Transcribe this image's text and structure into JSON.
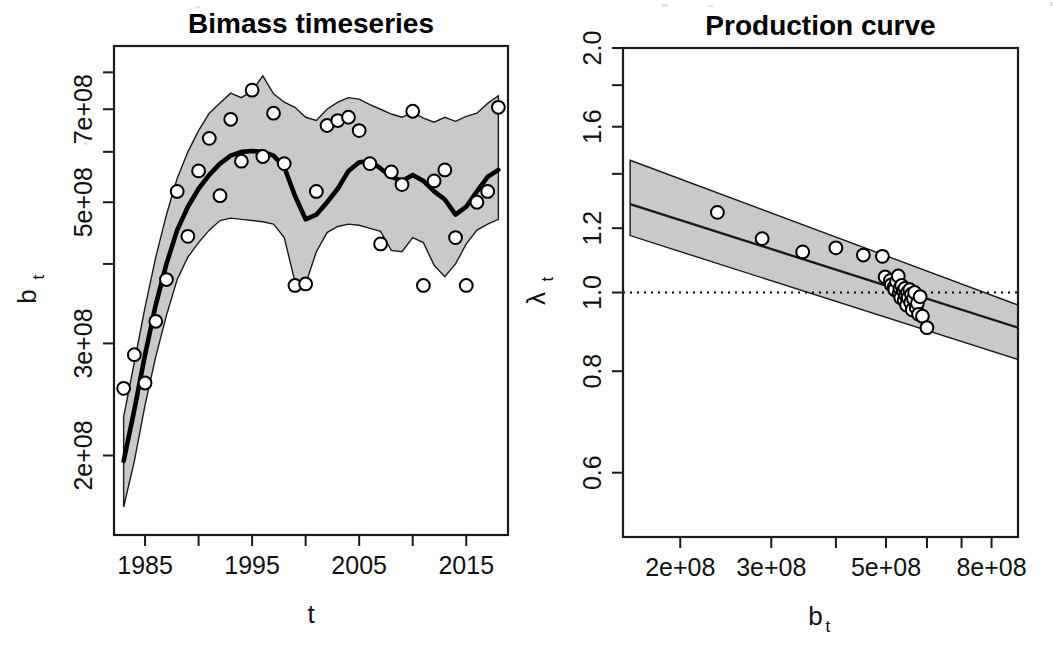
{
  "figure": {
    "background": "#ffffff",
    "ink_color": "#000000",
    "ribbon_color": "#c9c9c9",
    "width": 1053,
    "height": 651
  },
  "panels": [
    {
      "id": "biomass",
      "title": "Bimass timeseries",
      "xlabel": "t",
      "ylabel_base": "b",
      "ylabel_sub": "t",
      "frame": {
        "x0": 114,
        "y0": 46,
        "x1": 508,
        "y1": 535
      },
      "x_axis": {
        "scale": "linear",
        "range": [
          1982.1,
          2018.9
        ],
        "ticks": [
          1985,
          1990,
          1995,
          2000,
          2005,
          2010,
          2015
        ],
        "tick_labels": [
          "1985",
          "",
          "1995",
          "",
          "2005",
          "",
          "2015"
        ]
      },
      "y_axis": {
        "scale": "log",
        "range": [
          150000000,
          880000000
        ],
        "ticks": [
          200000000,
          300000000,
          400000000,
          500000000,
          600000000,
          700000000,
          800000000
        ],
        "tick_labels": [
          "2e+08",
          "3e+08",
          "",
          "5e+08",
          "",
          "7e+08",
          ""
        ]
      }
    },
    {
      "id": "production",
      "title": "Production curve",
      "xlabel_base": "b",
      "xlabel_sub": "t",
      "ylabel_base": "λ",
      "ylabel_sub": "t",
      "frame": {
        "x0": 623,
        "y0": 48,
        "x1": 1018,
        "y1": 537
      },
      "x_axis": {
        "scale": "log",
        "range": [
          155000000,
          900000000
        ],
        "ticks": [
          200000000,
          300000000,
          400000000,
          500000000,
          600000000,
          700000000,
          800000000
        ],
        "tick_labels": [
          "2e+08",
          "3e+08",
          "",
          "5e+08",
          "",
          "",
          "8e+08"
        ]
      },
      "y_axis": {
        "scale": "log",
        "range": [
          0.5,
          2.0
        ],
        "ticks": [
          0.6,
          0.8,
          1.0,
          1.2,
          1.4,
          1.6,
          1.8,
          2.0
        ],
        "tick_labels": [
          "0.6",
          "0.8",
          "1.0",
          "1.2",
          "",
          "1.6",
          "",
          "2.0"
        ]
      },
      "reference_line": {
        "y": 1.0,
        "style": "dotted"
      }
    }
  ],
  "chart_data": [
    {
      "type": "line",
      "title": "Bimass timeseries",
      "xlabel": "t",
      "ylabel": "b_t",
      "xlim": [
        1982.1,
        2018.9
      ],
      "ylim": [
        150000000,
        880000000
      ],
      "yscale": "log",
      "grid": false,
      "legend": "none",
      "series": [
        {
          "name": "median biomass",
          "style": "thick-black-line",
          "x": [
            1983,
            1984,
            1985,
            1986,
            1987,
            1988,
            1989,
            1990,
            1991,
            1992,
            1993,
            1994,
            1995,
            1996,
            1997,
            1998,
            1999,
            2000,
            2001,
            2002,
            2003,
            2004,
            2005,
            2006,
            2007,
            2008,
            2009,
            2010,
            2011,
            2012,
            2013,
            2014,
            2015,
            2016,
            2017,
            2018
          ],
          "y": [
            196000000,
            236000000,
            288000000,
            345000000,
            400000000,
            452000000,
            492000000,
            525000000,
            552000000,
            575000000,
            592000000,
            600000000,
            602000000,
            600000000,
            592000000,
            568000000,
            512000000,
            470000000,
            478000000,
            500000000,
            525000000,
            560000000,
            578000000,
            580000000,
            565000000,
            548000000,
            540000000,
            552000000,
            540000000,
            520000000,
            505000000,
            478000000,
            492000000,
            520000000,
            548000000,
            562000000
          ]
        },
        {
          "name": "95% credible interval upper",
          "style": "ribbon-edge",
          "x": [
            1983,
            1984,
            1985,
            1986,
            1987,
            1988,
            1989,
            1990,
            1991,
            1992,
            1993,
            1994,
            1995,
            1996,
            1997,
            1998,
            1999,
            2000,
            2001,
            2002,
            2003,
            2004,
            2005,
            2006,
            2007,
            2008,
            2009,
            2010,
            2011,
            2012,
            2013,
            2014,
            2015,
            2016,
            2017,
            2018
          ],
          "y": [
            230000000,
            280000000,
            342000000,
            410000000,
            478000000,
            545000000,
            600000000,
            648000000,
            690000000,
            716000000,
            742000000,
            730000000,
            748000000,
            790000000,
            740000000,
            718000000,
            705000000,
            680000000,
            672000000,
            700000000,
            718000000,
            730000000,
            726000000,
            712000000,
            700000000,
            688000000,
            680000000,
            692000000,
            678000000,
            668000000,
            680000000,
            670000000,
            682000000,
            690000000,
            715000000,
            735000000
          ]
        },
        {
          "name": "95% credible interval lower",
          "style": "ribbon-edge",
          "x": [
            1983,
            1984,
            1985,
            1986,
            1987,
            1988,
            1989,
            1990,
            1991,
            1992,
            1993,
            1994,
            1995,
            1996,
            1997,
            1998,
            1999,
            2000,
            2001,
            2002,
            2003,
            2004,
            2005,
            2006,
            2007,
            2008,
            2009,
            2010,
            2011,
            2012,
            2013,
            2014,
            2015,
            2016,
            2017,
            2018
          ],
          "y": [
            166000000,
            196000000,
            240000000,
            286000000,
            332000000,
            378000000,
            410000000,
            432000000,
            452000000,
            468000000,
            472000000,
            470000000,
            468000000,
            466000000,
            462000000,
            440000000,
            375000000,
            372000000,
            418000000,
            448000000,
            458000000,
            462000000,
            460000000,
            455000000,
            450000000,
            420000000,
            418000000,
            440000000,
            432000000,
            398000000,
            382000000,
            400000000,
            430000000,
            452000000,
            462000000,
            470000000
          ]
        },
        {
          "name": "observed biomass",
          "style": "open-circles",
          "x": [
            1983,
            1984,
            1985,
            1986,
            1987,
            1988,
            1989,
            1990,
            1991,
            1992,
            1993,
            1994,
            1995,
            1996,
            1997,
            1998,
            1999,
            2000,
            2001,
            2002,
            2003,
            2004,
            2005,
            2006,
            2007,
            2008,
            2009,
            2010,
            2011,
            2012,
            2013,
            2014,
            2015,
            2016,
            2017,
            2018
          ],
          "y": [
            255000000,
            288000000,
            260000000,
            325000000,
            378000000,
            520000000,
            442000000,
            560000000,
            630000000,
            512000000,
            675000000,
            580000000,
            750000000,
            590000000,
            690000000,
            575000000,
            370000000,
            372000000,
            520000000,
            660000000,
            672000000,
            680000000,
            648000000,
            575000000,
            430000000,
            558000000,
            533000000,
            695000000,
            370000000,
            540000000,
            562000000,
            440000000,
            370000000,
            500000000,
            520000000,
            705000000
          ]
        }
      ]
    },
    {
      "type": "scatter",
      "title": "Production curve",
      "xlabel": "b_t",
      "ylabel": "lambda_t",
      "xlim": [
        155000000,
        900000000
      ],
      "ylim": [
        0.5,
        2.0
      ],
      "xscale": "log",
      "yscale": "log",
      "grid": false,
      "legend": "none",
      "annotations": [
        {
          "type": "hline",
          "y": 1.0,
          "style": "dotted"
        }
      ],
      "series": [
        {
          "name": "fitted production curve",
          "style": "line",
          "x": [
            160000000,
            900000000
          ],
          "y": [
            1.285,
            0.905
          ]
        },
        {
          "name": "95% band upper",
          "style": "ribbon-edge",
          "x": [
            160000000,
            900000000
          ],
          "y": [
            1.455,
            0.965
          ]
        },
        {
          "name": "95% band lower",
          "style": "ribbon-edge",
          "x": [
            160000000,
            900000000
          ],
          "y": [
            1.175,
            0.827
          ]
        },
        {
          "name": "observed lambda",
          "style": "open-circles",
          "x": [
            236000000,
            288000000,
            345000000,
            400000000,
            452000000,
            492000000,
            498000000,
            510000000,
            512000000,
            518000000,
            520000000,
            524000000,
            528000000,
            530000000,
            532000000,
            534000000,
            536000000,
            540000000,
            542000000,
            544000000,
            546000000,
            548000000,
            550000000,
            552000000,
            556000000,
            558000000,
            560000000,
            562000000,
            565000000,
            568000000,
            572000000,
            575000000,
            578000000,
            582000000,
            588000000,
            600000000
          ],
          "y": [
            1.255,
            1.165,
            1.122,
            1.135,
            1.112,
            1.108,
            1.045,
            1.035,
            1.022,
            1.015,
            1.008,
            1.032,
            1.048,
            0.998,
            1.012,
            0.985,
            1.02,
            1.005,
            0.978,
            1.012,
            0.992,
            0.965,
            1.0,
            0.985,
            1.008,
            0.972,
            0.995,
            0.952,
            0.982,
            1.0,
            0.958,
            0.97,
            0.94,
            0.988,
            0.935,
            0.905
          ]
        }
      ]
    }
  ]
}
